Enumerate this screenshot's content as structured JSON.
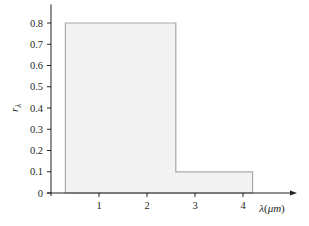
{
  "chart_data": {
    "type": "area",
    "title": "",
    "xlabel": "λ(μm)",
    "ylabel": "r_λ",
    "xlim": [
      0,
      5.1
    ],
    "ylim": [
      0,
      0.85
    ],
    "x_ticks": [
      1,
      2,
      3,
      4
    ],
    "x_tick_labels": [
      "1",
      "2",
      "3",
      "4"
    ],
    "y_ticks": [
      0,
      0.1,
      0.2,
      0.3,
      0.4,
      0.5,
      0.6,
      0.7,
      0.8
    ],
    "y_tick_labels": [
      "0",
      "0.1",
      "0.2",
      "0.3",
      "0.4",
      "0.5",
      "0.6",
      "0.7",
      "0.8"
    ],
    "grid": false,
    "legend": null,
    "series": [
      {
        "name": "spectral reflectivity",
        "step": true,
        "x": [
          0.3,
          0.3,
          2.6,
          2.6,
          4.2,
          4.2
        ],
        "y": [
          0,
          0.8,
          0.8,
          0.1,
          0.1,
          0
        ],
        "segments": [
          {
            "x_start": 0.3,
            "x_end": 2.6,
            "value": 0.8
          },
          {
            "x_start": 2.6,
            "x_end": 4.2,
            "value": 0.1
          }
        ]
      }
    ],
    "colors": {
      "fill": "#f2f2f2",
      "outline": "#a7a9ac",
      "axis": "#231f20"
    }
  }
}
